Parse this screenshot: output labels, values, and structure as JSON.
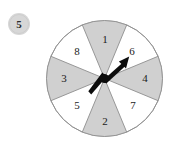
{
  "figure": {
    "kind": "spinner-wheel",
    "background_color": "#ffffff",
    "width": 179,
    "height": 154
  },
  "problem_badge": {
    "number": "5",
    "fill_color": "#d7d7d7",
    "text_color": "#2b2b2b",
    "center_x": 19,
    "center_y": 24,
    "radius": 11
  },
  "wheel": {
    "center_x": 104.5,
    "center_y": 78.5,
    "radius": 58,
    "sector_count": 8,
    "sector_span_degrees": 45,
    "outline_color": "#9a9a9a",
    "shaded_fill": "#d0d0d0",
    "unshaded_fill": "#ffffff",
    "sectors": [
      {
        "label": "1",
        "shaded": true,
        "start_angle": -112.5,
        "end_angle": -67.5,
        "label_x": 105,
        "label_y": 40
      },
      {
        "label": "6",
        "shaded": false,
        "start_angle": -67.5,
        "end_angle": -22.5,
        "label_x": 132,
        "label_y": 52
      },
      {
        "label": "4",
        "shaded": true,
        "start_angle": -22.5,
        "end_angle": 22.5,
        "label_x": 145,
        "label_y": 79
      },
      {
        "label": "7",
        "shaded": false,
        "start_angle": 22.5,
        "end_angle": 67.5,
        "label_x": 133,
        "label_y": 106
      },
      {
        "label": "2",
        "shaded": true,
        "start_angle": 67.5,
        "end_angle": 112.5,
        "label_x": 105,
        "label_y": 122
      },
      {
        "label": "5",
        "shaded": false,
        "start_angle": 112.5,
        "end_angle": 157.5,
        "label_x": 77,
        "label_y": 106
      },
      {
        "label": "3",
        "shaded": true,
        "start_angle": 157.5,
        "end_angle": 202.5,
        "label_x": 64,
        "label_y": 79
      },
      {
        "label": "8",
        "shaded": false,
        "start_angle": 202.5,
        "end_angle": 247.5,
        "label_x": 77,
        "label_y": 52
      }
    ]
  },
  "spinner": {
    "color": "#0d0d0d",
    "pivot_x": 104.5,
    "pivot_y": 78.5,
    "pointing_at_sector": "6",
    "head_x": 128,
    "head_y": 58,
    "tail_x": 90,
    "tail_y": 92,
    "hub_radius": 4.5
  }
}
